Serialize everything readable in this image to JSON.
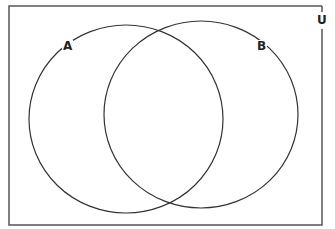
{
  "diagram": {
    "type": "venn",
    "universe_label": "U",
    "sets": [
      {
        "label": "A"
      },
      {
        "label": "B"
      }
    ],
    "colors": {
      "stroke": "#333333",
      "background": "#ffffff"
    }
  }
}
